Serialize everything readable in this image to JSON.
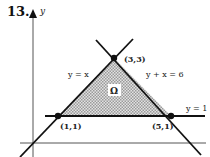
{
  "problem_number": "13.",
  "axes": {
    "y_label": "y"
  },
  "region_label": "Ω",
  "lines": [
    {
      "label": "y = x"
    },
    {
      "label": "y + x = 6"
    },
    {
      "label": "y = 1"
    }
  ],
  "points": [
    {
      "label": "(3,3)"
    },
    {
      "label": "(1,1)"
    },
    {
      "label": "(5,1)"
    }
  ],
  "colors": {
    "ink": "#111111",
    "fill": "#bdbdbd",
    "axis": "#555555"
  }
}
